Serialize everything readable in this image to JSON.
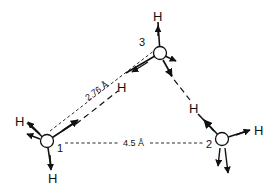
{
  "diagram": {
    "type": "molecular-cluster",
    "colors": {
      "ink": "#111111",
      "background": "#ffffff"
    },
    "oxygens": [
      {
        "id": "1",
        "label": "1",
        "x": 47,
        "y": 141
      },
      {
        "id": "2",
        "label": "2",
        "x": 222,
        "y": 139
      },
      {
        "id": "3",
        "label": "3",
        "x": 160,
        "y": 53
      }
    ],
    "hydrogen_label": "H",
    "distances": [
      {
        "between": [
          "1",
          "3"
        ],
        "label": "2.76 Å"
      },
      {
        "between": [
          "1",
          "2"
        ],
        "label": "4.5 Å"
      }
    ],
    "labels": {
      "o1": "1",
      "o2": "2",
      "o3": "3",
      "d13": "2.76 Å",
      "d12": "4.5 Å",
      "h": "H"
    }
  }
}
